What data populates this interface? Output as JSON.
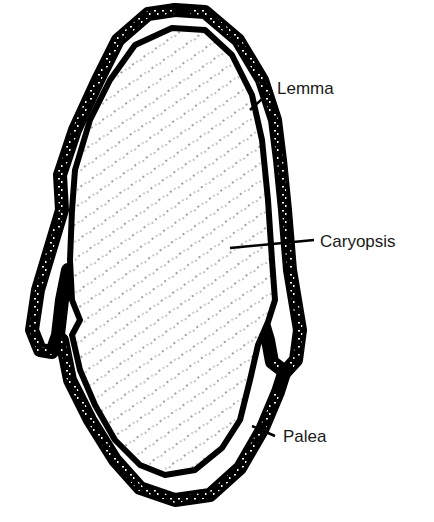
{
  "figure": {
    "colors": {
      "ink": "#000000",
      "background": "#ffffff",
      "label_text": "#1a1a1a"
    },
    "labels": [
      {
        "id": "lemma",
        "text": "Lemma"
      },
      {
        "id": "caryopsis",
        "text": "Caryopsis"
      },
      {
        "id": "palea",
        "text": "Palea"
      }
    ]
  }
}
